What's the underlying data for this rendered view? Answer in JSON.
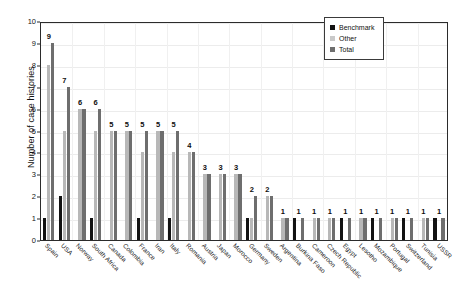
{
  "chart_data": {
    "type": "bar",
    "title": "",
    "xlabel": "",
    "ylabel": "Number of case histories",
    "ylim": [
      0,
      10
    ],
    "ytick_labels": [
      "0",
      "1",
      "2",
      "3",
      "4",
      "5",
      "6",
      "7",
      "8",
      "9",
      "10"
    ],
    "grid": true,
    "legend_position": "top-right",
    "legend": [
      "Benchmark",
      "Other",
      "Total"
    ],
    "colors": {
      "Benchmark": "#121212",
      "Other": "#b8b8b8",
      "Total": "#6e6e6e",
      "axis": "#2b2b2b",
      "grid": "#ececec",
      "background": "#ffffff"
    },
    "categories": [
      "Spain",
      "USA",
      "Norway",
      "South Africa",
      "Canada",
      "Colombia",
      "France",
      "Iran",
      "Italy",
      "Romania",
      "Austria",
      "Japan",
      "Morocco",
      "Germany",
      "Sweden",
      "Argentina",
      "Burkina Faso",
      "Cameroon",
      "Czech Republic",
      "Egypt",
      "Lesotho",
      "Mozambique",
      "Portugal",
      "Switzerland",
      "Tunisia",
      "USSR"
    ],
    "series": [
      {
        "name": "Benchmark",
        "values": [
          1,
          2,
          0,
          1,
          0,
          0,
          1,
          0,
          1,
          0,
          0,
          0,
          0,
          1,
          0,
          0,
          1,
          0,
          0,
          1,
          0,
          1,
          0,
          1,
          0,
          1
        ]
      },
      {
        "name": "Other",
        "values": [
          8,
          5,
          6,
          5,
          5,
          5,
          4,
          5,
          4,
          4,
          3,
          3,
          3,
          1,
          2,
          1,
          0,
          1,
          1,
          0,
          1,
          0,
          1,
          0,
          1,
          0
        ]
      },
      {
        "name": "Total",
        "values": [
          9,
          7,
          6,
          6,
          5,
          5,
          5,
          5,
          5,
          4,
          3,
          3,
          3,
          2,
          2,
          1,
          1,
          1,
          1,
          1,
          1,
          1,
          1,
          1,
          1,
          1
        ]
      }
    ],
    "total_labels": [
      "9",
      "7",
      "6",
      "6",
      "5",
      "5",
      "5",
      "5",
      "5",
      "4",
      "3",
      "3",
      "3",
      "2",
      "2",
      "1",
      "1",
      "1",
      "1",
      "1",
      "1",
      "1",
      "1",
      "1",
      "1",
      "1"
    ]
  }
}
